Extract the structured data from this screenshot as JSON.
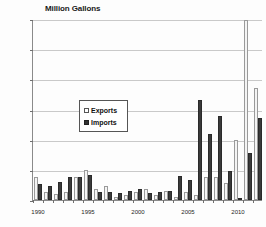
{
  "chart_data": {
    "type": "bar",
    "title": "Million Gallons",
    "xlabel": "",
    "ylabel": "Million Gallons",
    "ylim": [
      0,
      1200
    ],
    "yticks": [
      "0",
      "200",
      "400",
      "600",
      "800",
      "1,000",
      "1,200"
    ],
    "ytick_values": [
      0,
      200,
      400,
      600,
      800,
      1000,
      1200
    ],
    "grid": true,
    "legend_position": "center-left",
    "categories": [
      "1990",
      "1991",
      "1992",
      "1993",
      "1994",
      "1995",
      "1996",
      "1997",
      "1998",
      "1999",
      "2000",
      "2001",
      "2002",
      "2003",
      "2004",
      "2005",
      "2006",
      "2007",
      "2008",
      "2009",
      "2010",
      "2011",
      "2012"
    ],
    "xtick_labels": [
      "1990",
      "1995",
      "2000",
      "2005",
      "2010"
    ],
    "xtick_categories": [
      "1990",
      "1995",
      "2000",
      "2005",
      "2010"
    ],
    "series": [
      {
        "name": "Exports",
        "color": "#f4f4f4",
        "values": [
          150,
          55,
          40,
          50,
          150,
          200,
          70,
          95,
          20,
          35,
          50,
          70,
          35,
          60,
          20,
          50,
          35,
          150,
          155,
          115,
          400,
          1195,
          740
        ]
      },
      {
        "name": "Imports",
        "color": "#3a3a3a",
        "values": [
          105,
          90,
          120,
          155,
          155,
          165,
          55,
          50,
          45,
          60,
          75,
          45,
          55,
          60,
          160,
          135,
          660,
          440,
          555,
          195,
          15,
          315,
          545
        ]
      }
    ]
  },
  "legend": {
    "items": [
      {
        "label": "Exports"
      },
      {
        "label": "Imports"
      }
    ]
  }
}
